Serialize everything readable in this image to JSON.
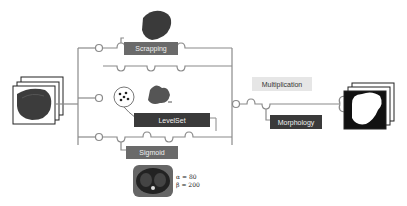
{
  "diagram": {
    "input": {
      "icon": "ct-image-stack-icon"
    },
    "stages": [
      {
        "label": "Scrapping",
        "style": "mid",
        "icon": "liver-segment-icon"
      },
      {
        "label": "LevelSet",
        "style": "dark",
        "icon": "seed-points-icon"
      },
      {
        "label": "Sigmoid",
        "style": "mid",
        "icon": "ct-slice-icon"
      }
    ],
    "sigmoid_params": {
      "alpha": "α = 80",
      "beta": "β = 200"
    },
    "combine": {
      "label": "Multiplication"
    },
    "post": {
      "label": "Morphology"
    },
    "output": {
      "icon": "binary-mask-stack-icon"
    },
    "colors": {
      "line": "#8a8a8a",
      "dark_box": "#3a3a3a",
      "mid_box": "#6a6a6a",
      "light_box": "#e6e6e6"
    }
  }
}
